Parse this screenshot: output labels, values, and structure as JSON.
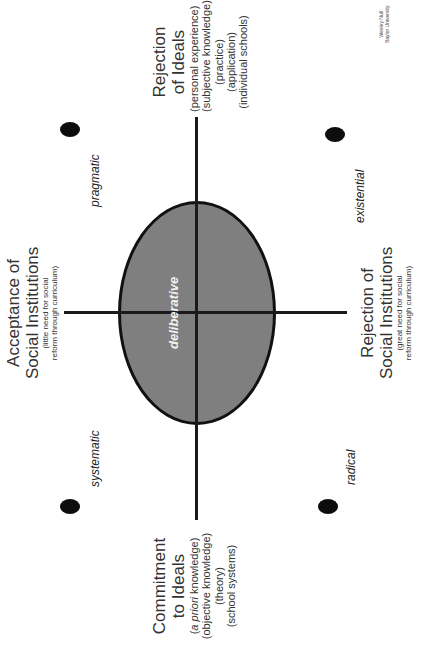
{
  "diagram": {
    "center_label": "deliberative",
    "credit": {
      "line1": "Wesley Null",
      "line2": "Baylor University"
    },
    "axes": {
      "right": {
        "title_line1": "Rejection",
        "title_line2": "of Ideals",
        "sub": [
          "(personal experience)",
          "(subjective knowledge)",
          "(practice)",
          "(application)",
          "(individual schools)"
        ]
      },
      "left": {
        "title_line1": "Commitment",
        "title_line2": "to Ideals",
        "sub_italic": "a priori",
        "sub_first_rest": " knowledge)",
        "sub": [
          "(objective knowledge)",
          "(theory)",
          "(school systems)"
        ]
      },
      "top": {
        "title_line1": "Acceptance of",
        "title_line2": "Social Institutions",
        "sub_line1": "(little need for social",
        "sub_line2": "reform through curriculum)"
      },
      "bottom": {
        "title_line1": "Rejection of",
        "title_line2": "Social Institutions",
        "sub_line1": "(great need for social",
        "sub_line2": "reform through curriculum)"
      }
    },
    "quadrants": {
      "top_right": "pragmatic",
      "top_left": "systematic",
      "bottom_right": "existential",
      "bottom_left": "radical"
    },
    "colors": {
      "ellipse_fill": "#7f7f7f",
      "line": "#1a1a1a",
      "dot": "#0d0d0d"
    }
  }
}
